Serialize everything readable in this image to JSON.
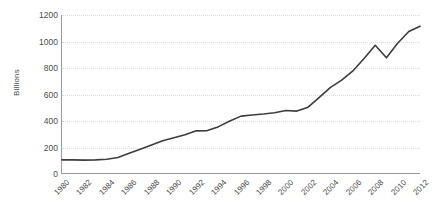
{
  "chart_data": {
    "type": "line",
    "title": "",
    "xlabel": "",
    "ylabel": "Billions",
    "ylim": [
      0,
      1200
    ],
    "xlim": [
      1980,
      2012
    ],
    "grid": true,
    "legend": "none",
    "y_ticks": [
      0,
      200,
      400,
      600,
      800,
      1000,
      1200
    ],
    "y_tick_labels": [
      "0",
      "200",
      "400",
      "600",
      "800",
      "1000",
      "1200"
    ],
    "x_ticks": [
      1980,
      1982,
      1984,
      1986,
      1988,
      1990,
      1992,
      1994,
      1996,
      1998,
      2000,
      2002,
      2004,
      2006,
      2008,
      2010,
      2012
    ],
    "x_tick_labels": [
      "1980",
      "1982",
      "1984",
      "1986",
      "1988",
      "1990",
      "1992",
      "1994",
      "1996",
      "1998",
      "2000",
      "2002",
      "2004",
      "2006",
      "2008",
      "2010",
      "2012"
    ],
    "series": [
      {
        "name": "Billions",
        "color": "#3d3d3d",
        "x": [
          1980,
          1981,
          1982,
          1983,
          1984,
          1985,
          1986,
          1987,
          1988,
          1989,
          1990,
          1991,
          1992,
          1993,
          1994,
          1995,
          1996,
          1997,
          1998,
          1999,
          2000,
          2001,
          2002,
          2003,
          2004,
          2005,
          2006,
          2007,
          2008,
          2009,
          2010,
          2011,
          2012
        ],
        "values": [
          100,
          100,
          98,
          100,
          105,
          118,
          150,
          180,
          212,
          245,
          268,
          290,
          320,
          322,
          352,
          395,
          432,
          440,
          448,
          458,
          475,
          470,
          500,
          575,
          650,
          705,
          775,
          870,
          970,
          875,
          985,
          1075,
          1115
        ]
      }
    ]
  },
  "axis": {
    "y_title": "Billions",
    "line_color": "#9a9a9a",
    "grid_color": "#dcdcdc",
    "tick_text_color": "#4d4d4d"
  }
}
